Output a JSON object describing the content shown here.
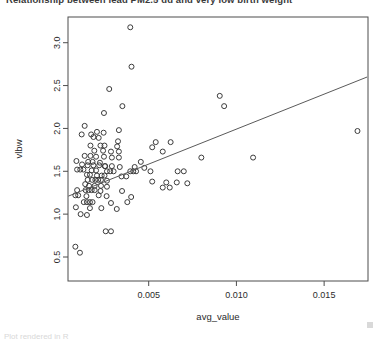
{
  "title": {
    "text": "Relationship between lead PM2.5 dd and very low birth weight",
    "clipped": "true"
  },
  "footer": {
    "text": "Plot rendered in R"
  },
  "colors": {
    "point_stroke": "#3c3c3c",
    "line": "#5a5a5a",
    "frame": "#4d4d4d",
    "text": "#2b2b2b"
  },
  "chart_data": {
    "type": "scatter",
    "title": "Relationship between lead PM2.5 dd and very low birth weight",
    "xlabel": "avg_value",
    "ylabel": "vlbw",
    "xlim": [
      0.0004,
      0.0175
    ],
    "ylim": [
      0.22,
      3.3
    ],
    "xticks": [
      0.005,
      0.01,
      0.015
    ],
    "xtick_labels": [
      "0.005",
      "0.010",
      "0.015"
    ],
    "yticks": [
      0.5,
      1.0,
      1.5,
      2.0,
      2.5,
      3.0
    ],
    "ytick_labels": [
      "0.5",
      "1.0",
      "1.5",
      "2.0",
      "2.5",
      "3.0"
    ],
    "grid": false,
    "legend": "none",
    "marker": "open-circle",
    "fit_line": {
      "type": "linear",
      "x_start": 0.00042,
      "y_start": 1.21,
      "x_end": 0.01745,
      "y_end": 2.6
    },
    "points": [
      {
        "x": 0.00395,
        "y": 3.18
      },
      {
        "x": 0.00402,
        "y": 2.72
      },
      {
        "x": 0.00275,
        "y": 2.46
      },
      {
        "x": 0.0035,
        "y": 2.26
      },
      {
        "x": 0.00245,
        "y": 2.18
      },
      {
        "x": 0.00135,
        "y": 2.03
      },
      {
        "x": 0.0033,
        "y": 1.98
      },
      {
        "x": 0.00205,
        "y": 1.96
      },
      {
        "x": 0.00243,
        "y": 1.95
      },
      {
        "x": 0.0169,
        "y": 1.97
      },
      {
        "x": 0.00185,
        "y": 1.9
      },
      {
        "x": 0.00215,
        "y": 1.89
      },
      {
        "x": 0.00325,
        "y": 1.85
      },
      {
        "x": 0.0054,
        "y": 1.84
      },
      {
        "x": 0.00625,
        "y": 1.84
      },
      {
        "x": 0.00905,
        "y": 2.38
      },
      {
        "x": 0.0093,
        "y": 2.26
      },
      {
        "x": 0.00168,
        "y": 1.8
      },
      {
        "x": 0.00225,
        "y": 1.8
      },
      {
        "x": 0.00248,
        "y": 1.8
      },
      {
        "x": 0.0032,
        "y": 1.79
      },
      {
        "x": 0.0052,
        "y": 1.78
      },
      {
        "x": 0.0019,
        "y": 1.74
      },
      {
        "x": 0.0024,
        "y": 1.74
      },
      {
        "x": 0.00285,
        "y": 1.73
      },
      {
        "x": 0.0033,
        "y": 1.73
      },
      {
        "x": 0.0058,
        "y": 1.73
      },
      {
        "x": 0.008,
        "y": 1.66
      },
      {
        "x": 0.01095,
        "y": 1.66
      },
      {
        "x": 0.00135,
        "y": 1.68
      },
      {
        "x": 0.00168,
        "y": 1.68
      },
      {
        "x": 0.002,
        "y": 1.67
      },
      {
        "x": 0.00245,
        "y": 1.67
      },
      {
        "x": 0.0029,
        "y": 1.66
      },
      {
        "x": 0.0033,
        "y": 1.66
      },
      {
        "x": 0.00088,
        "y": 1.62
      },
      {
        "x": 0.00155,
        "y": 1.61
      },
      {
        "x": 0.0018,
        "y": 1.61
      },
      {
        "x": 0.00222,
        "y": 1.6
      },
      {
        "x": 0.0012,
        "y": 1.58
      },
      {
        "x": 0.00152,
        "y": 1.57
      },
      {
        "x": 0.00185,
        "y": 1.57
      },
      {
        "x": 0.00218,
        "y": 1.57
      },
      {
        "x": 0.0025,
        "y": 1.56
      },
      {
        "x": 0.0029,
        "y": 1.56
      },
      {
        "x": 0.00335,
        "y": 1.55
      },
      {
        "x": 0.0042,
        "y": 1.55
      },
      {
        "x": 0.00475,
        "y": 1.54
      },
      {
        "x": 0.00092,
        "y": 1.52
      },
      {
        "x": 0.0011,
        "y": 1.52
      },
      {
        "x": 0.00128,
        "y": 1.52
      },
      {
        "x": 0.00175,
        "y": 1.51
      },
      {
        "x": 0.002,
        "y": 1.51
      },
      {
        "x": 0.00262,
        "y": 1.5
      },
      {
        "x": 0.0028,
        "y": 1.5
      },
      {
        "x": 0.003,
        "y": 1.5
      },
      {
        "x": 0.00395,
        "y": 1.5
      },
      {
        "x": 0.00412,
        "y": 1.5
      },
      {
        "x": 0.00428,
        "y": 1.5
      },
      {
        "x": 0.00148,
        "y": 1.46
      },
      {
        "x": 0.00165,
        "y": 1.46
      },
      {
        "x": 0.00205,
        "y": 1.45
      },
      {
        "x": 0.00232,
        "y": 1.45
      },
      {
        "x": 0.00248,
        "y": 1.45
      },
      {
        "x": 0.00345,
        "y": 1.44
      },
      {
        "x": 0.00372,
        "y": 1.44
      },
      {
        "x": 0.00152,
        "y": 1.4
      },
      {
        "x": 0.00178,
        "y": 1.4
      },
      {
        "x": 0.00196,
        "y": 1.4
      },
      {
        "x": 0.00212,
        "y": 1.4
      },
      {
        "x": 0.00228,
        "y": 1.4
      },
      {
        "x": 0.00262,
        "y": 1.39
      },
      {
        "x": 0.0052,
        "y": 1.38
      },
      {
        "x": 0.006,
        "y": 1.37
      },
      {
        "x": 0.0066,
        "y": 1.37
      },
      {
        "x": 0.0072,
        "y": 1.36
      },
      {
        "x": 0.0016,
        "y": 1.33
      },
      {
        "x": 0.00192,
        "y": 1.33
      },
      {
        "x": 0.00228,
        "y": 1.33
      },
      {
        "x": 0.00262,
        "y": 1.32
      },
      {
        "x": 0.0058,
        "y": 1.31
      },
      {
        "x": 0.0062,
        "y": 1.31
      },
      {
        "x": 0.00092,
        "y": 1.28
      },
      {
        "x": 0.0014,
        "y": 1.28
      },
      {
        "x": 0.00158,
        "y": 1.28
      },
      {
        "x": 0.00175,
        "y": 1.28
      },
      {
        "x": 0.00192,
        "y": 1.28
      },
      {
        "x": 0.00225,
        "y": 1.27
      },
      {
        "x": 0.00348,
        "y": 1.27
      },
      {
        "x": 0.00082,
        "y": 1.22
      },
      {
        "x": 0.00098,
        "y": 1.22
      },
      {
        "x": 0.00145,
        "y": 1.21
      },
      {
        "x": 0.0026,
        "y": 1.21
      },
      {
        "x": 0.004,
        "y": 1.2
      },
      {
        "x": 0.0013,
        "y": 1.14
      },
      {
        "x": 0.00148,
        "y": 1.14
      },
      {
        "x": 0.00165,
        "y": 1.14
      },
      {
        "x": 0.0018,
        "y": 1.14
      },
      {
        "x": 0.00285,
        "y": 1.13
      },
      {
        "x": 0.00085,
        "y": 1.08
      },
      {
        "x": 0.00165,
        "y": 1.07
      },
      {
        "x": 0.0023,
        "y": 1.07
      },
      {
        "x": 0.00318,
        "y": 1.06
      },
      {
        "x": 0.00112,
        "y": 1.0
      },
      {
        "x": 0.00148,
        "y": 0.99
      },
      {
        "x": 0.00255,
        "y": 0.8
      },
      {
        "x": 0.00285,
        "y": 0.8
      },
      {
        "x": 0.00082,
        "y": 0.62
      },
      {
        "x": 0.00108,
        "y": 0.55
      },
      {
        "x": 0.00118,
        "y": 1.93
      },
      {
        "x": 0.00172,
        "y": 1.93
      },
      {
        "x": 0.0051,
        "y": 1.5
      },
      {
        "x": 0.00455,
        "y": 1.61
      },
      {
        "x": 0.00138,
        "y": 1.35
      },
      {
        "x": 0.00215,
        "y": 1.22
      },
      {
        "x": 0.00252,
        "y": 1.56
      },
      {
        "x": 0.00665,
        "y": 1.5
      },
      {
        "x": 0.007,
        "y": 1.5
      },
      {
        "x": 0.00378,
        "y": 1.14
      }
    ]
  }
}
